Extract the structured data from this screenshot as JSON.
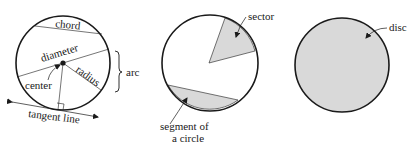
{
  "figure": {
    "panels": [
      {
        "name": "circle-parts",
        "labels": {
          "chord": "chord",
          "diameter": "diameter",
          "radius": "radius",
          "center": "center",
          "arc": "arc",
          "tangent_line": "tangent line"
        }
      },
      {
        "name": "sector-segment",
        "labels": {
          "sector": "sector",
          "segment_line1": "segment of",
          "segment_line2": "a circle"
        }
      },
      {
        "name": "disc",
        "labels": {
          "disc": "disc"
        }
      }
    ],
    "colors": {
      "stroke": "#1a1a1a",
      "fill_gray": "#d9d9d9",
      "background": "#ffffff"
    }
  }
}
